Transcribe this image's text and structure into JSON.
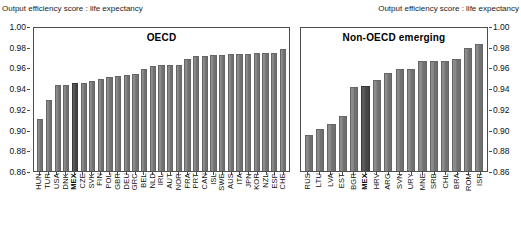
{
  "axis_titles": {
    "left": "Output efficiency score : life expectancy",
    "right": "Output efficiency score : life expectancy"
  },
  "chart_data": {
    "type": "bar",
    "title": "",
    "xlabel": "",
    "ylabel": "Output efficiency score : life expectancy",
    "ylim": [
      0.86,
      1.0
    ],
    "yticks": [
      "1.00",
      "0.98",
      "0.96",
      "0.94",
      "0.92",
      "0.90",
      "0.88",
      "0.86"
    ],
    "ytick_values": [
      1.0,
      0.98,
      0.96,
      0.94,
      0.92,
      0.9,
      0.88,
      0.86
    ],
    "grid": false,
    "legend": "none",
    "highlight_country": "MEX",
    "colors": {
      "bar": "#808080",
      "bar_highlight": "#4d4d4d",
      "axis": "#4d4d4d"
    },
    "panels": [
      {
        "name": "oecd",
        "title": "OECD",
        "categories": [
          "HUN",
          "TUR",
          "USA",
          "DNK",
          "MEX",
          "CZE",
          "SVK",
          "FIN",
          "POL",
          "GBR",
          "DEU",
          "GRC",
          "BEL",
          "NLD",
          "IRL",
          "AUT",
          "NOR",
          "FRA",
          "PRT",
          "CAN",
          "ISL",
          "SWE",
          "AUS",
          "ITA",
          "JPN",
          "KOR",
          "NZL",
          "ESP",
          "CHE"
        ],
        "values": [
          0.91,
          0.929,
          0.943,
          0.943,
          0.945,
          0.945,
          0.947,
          0.949,
          0.951,
          0.952,
          0.953,
          0.954,
          0.959,
          0.961,
          0.962,
          0.962,
          0.962,
          0.968,
          0.971,
          0.971,
          0.972,
          0.972,
          0.973,
          0.973,
          0.973,
          0.974,
          0.974,
          0.974,
          0.978
        ],
        "highlight_index": 4
      },
      {
        "name": "nonoecd",
        "title": "Non-OECD emerging",
        "categories": [
          "RUS",
          "LTU",
          "LVA",
          "EST",
          "BGR",
          "MEX",
          "HRV",
          "ARG",
          "SVN",
          "URY",
          "MNE",
          "SRB",
          "CHL",
          "BRA",
          "ROM",
          "ISR"
        ],
        "values": [
          0.895,
          0.901,
          0.905,
          0.913,
          0.941,
          0.942,
          0.948,
          0.955,
          0.959,
          0.959,
          0.966,
          0.966,
          0.966,
          0.968,
          0.979,
          0.983
        ],
        "highlight_index": 5
      }
    ]
  }
}
